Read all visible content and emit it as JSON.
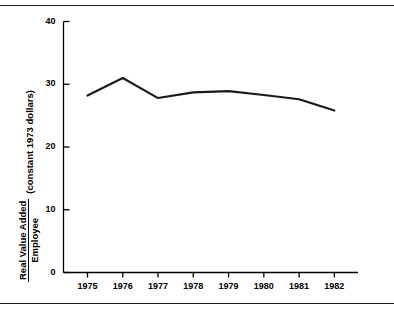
{
  "figure": {
    "background_color": "#ffffff",
    "line_color": "#1a1a1a",
    "axis_color": "#000000",
    "rule_top_label": "top-divider-rule",
    "rule_bottom_label": "bottom-divider-rule"
  },
  "axis_labels": {
    "y_numerator": "Real Value Added",
    "y_denominator": "Employee",
    "y_units": "(constant 1973 dollars)"
  },
  "chart_data": {
    "type": "line",
    "title": "",
    "subtitle": "",
    "xlabel": "",
    "ylabel": "Real Value Added / Employee (constant 1973 dollars)",
    "x": [
      "1975",
      "1976",
      "1977",
      "1978",
      "1979",
      "1980",
      "1981",
      "1982"
    ],
    "categories": [
      "1975",
      "1976",
      "1977",
      "1978",
      "1979",
      "1980",
      "1981",
      "1982"
    ],
    "values": [
      28.2,
      31.0,
      27.8,
      28.7,
      28.9,
      28.3,
      27.6,
      25.8
    ],
    "series": [
      {
        "name": "Real Value Added per Employee",
        "values": [
          28.2,
          31.0,
          27.8,
          28.7,
          28.9,
          28.3,
          27.6,
          25.8
        ]
      }
    ],
    "ylim": [
      0,
      40
    ],
    "yticks": [
      0,
      10,
      20,
      30,
      40
    ],
    "ytick_labels": [
      "0",
      "10",
      "20",
      "30",
      "40"
    ],
    "xtick_labels": [
      "1975",
      "1976",
      "1977",
      "1978",
      "1979",
      "1980",
      "1981",
      "1982"
    ],
    "grid": false,
    "legend": false,
    "legend_position": "none",
    "annotations": []
  }
}
